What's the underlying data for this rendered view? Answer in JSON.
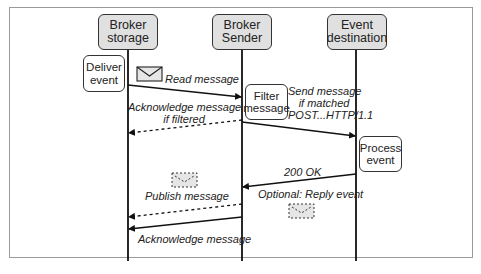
{
  "diagram": {
    "type": "sequence",
    "participants": [
      {
        "id": "storage",
        "line1": "Broker",
        "line2": "storage"
      },
      {
        "id": "sender",
        "line1": "Broker",
        "line2": "Sender"
      },
      {
        "id": "destination",
        "line1": "Event",
        "line2": "destination"
      }
    ],
    "activities": {
      "deliver": {
        "line1": "Deliver",
        "line2": "event"
      },
      "filter": {
        "line1": "Filter",
        "line2": "message"
      },
      "process": {
        "line1": "Process",
        "line2": "event"
      }
    },
    "messages": {
      "read": {
        "label": "Read message",
        "from": "storage",
        "to": "sender",
        "style": "solid"
      },
      "ack_filtered": {
        "line1": "Acknowledge message",
        "line2": "if filtered",
        "from": "sender",
        "to": "storage",
        "style": "dashed"
      },
      "send": {
        "line1": "Send message",
        "line2": "if matched",
        "line3": "POST...HTTP/1.1",
        "from": "sender",
        "to": "destination",
        "style": "solid"
      },
      "ok": {
        "label": "200 OK",
        "from": "destination",
        "to": "sender",
        "style": "solid"
      },
      "reply": {
        "label": "Optional: Reply event"
      },
      "publish": {
        "label": "Publish message",
        "from": "sender",
        "to": "storage",
        "style": "dashed"
      },
      "ack": {
        "label": "Acknowledge message",
        "from": "sender",
        "to": "storage",
        "style": "solid"
      }
    },
    "colors": {
      "header_fill": "#e0e0e0",
      "line": "#222222",
      "envelope_fill": "#e6e6e6"
    }
  }
}
